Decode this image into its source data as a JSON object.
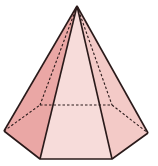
{
  "figure": {
    "shape": "hexagonal-pyramid",
    "colors": {
      "left_face": "#e8a0a0",
      "left_front_face": "#eeb4b2",
      "front_face": "#f6d6d4",
      "right_front_face": "#f2c6c4",
      "right_face": "#f4cfcc",
      "edge": "#2a1a1a"
    },
    "vertices": {
      "apex": [
        77,
        6
      ],
      "left": [
        4,
        131
      ],
      "front_left": [
        40,
        159
      ],
      "front_right": [
        112,
        159
      ],
      "right": [
        148,
        133
      ],
      "back_left": [
        40,
        105
      ],
      "back_right": [
        112,
        105
      ]
    }
  }
}
